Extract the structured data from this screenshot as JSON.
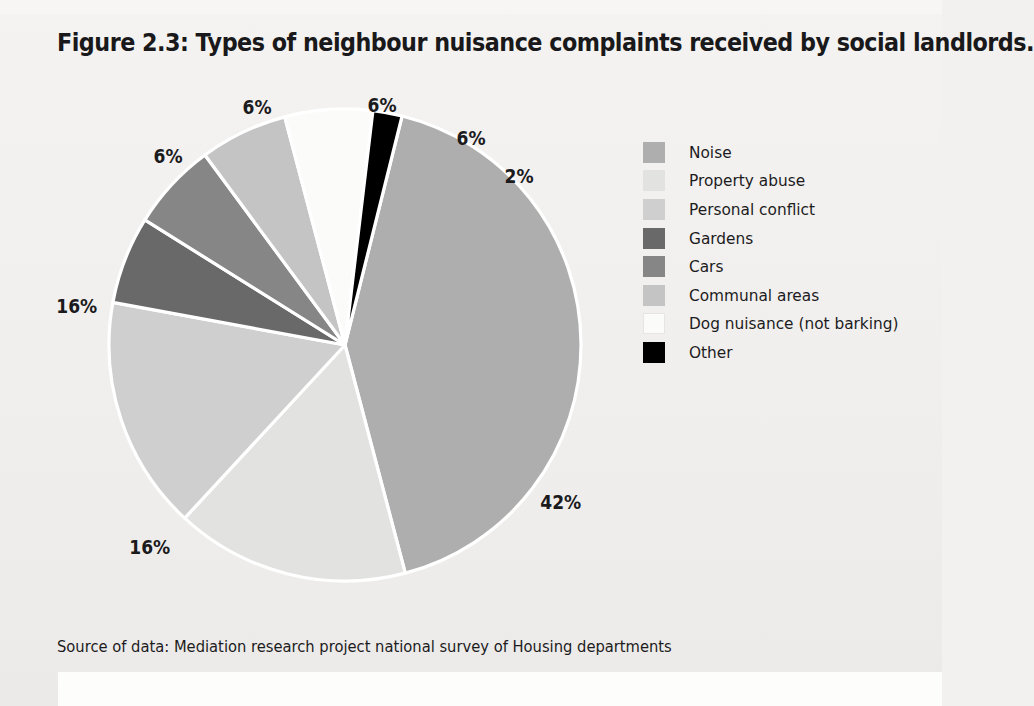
{
  "figure": {
    "title": "Figure 2.3:  Types of neighbour nuisance complaints received by social landlords.",
    "source": "Source of data: Mediation research project national survey of Housing departments"
  },
  "chart_data": {
    "type": "pie",
    "title": "Figure 2.3:  Types of neighbour nuisance complaints received by social landlords.",
    "xlabel": "",
    "ylabel": "",
    "legend_position": "right",
    "grid": false,
    "unit": "%",
    "categories": [
      "Noise",
      "Property abuse",
      "Personal conflict",
      "Gardens",
      "Cars",
      "Communal areas",
      "Dog nuisance (not barking)",
      "Other"
    ],
    "values": [
      42,
      16,
      16,
      6,
      6,
      6,
      6,
      2
    ],
    "labels": [
      "42%",
      "16%",
      "16%",
      "6%",
      "6%",
      "6%",
      "6%",
      "2%"
    ],
    "colors": [
      "#aeaeae",
      "#e2e2e1",
      "#cfcfcf",
      "#696969",
      "#868686",
      "#c4c4c4",
      "#fbfbfa",
      "#000000"
    ],
    "slice_separator_color": "#ffffff"
  },
  "legend": {
    "items": [
      {
        "label": "Noise",
        "swatch": "#aeaeae"
      },
      {
        "label": "Property abuse",
        "swatch": "#e2e2e1"
      },
      {
        "label": "Personal conflict",
        "swatch": "#cfcfcf"
      },
      {
        "label": "Gardens",
        "swatch": "#696969"
      },
      {
        "label": "Cars",
        "swatch": "#868686"
      },
      {
        "label": "Communal areas",
        "swatch": "#c4c4c4"
      },
      {
        "label": "Dog nuisance (not barking)",
        "swatch": "#fbfbfa"
      },
      {
        "label": "Other",
        "swatch": "#000000"
      }
    ]
  },
  "pie_labels": [
    {
      "text": "6%",
      "left": 241,
      "top": 16
    },
    {
      "text": "6%",
      "left": 366,
      "top": 14
    },
    {
      "text": "6%",
      "left": 152,
      "top": 65
    },
    {
      "text": "6%",
      "left": 455,
      "top": 47
    },
    {
      "text": "2%",
      "left": 503,
      "top": 85
    },
    {
      "text": "16%",
      "left": 54,
      "top": 215
    },
    {
      "text": "42%",
      "left": 538,
      "top": 411
    },
    {
      "text": "16%",
      "left": 127,
      "top": 456
    }
  ]
}
